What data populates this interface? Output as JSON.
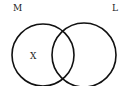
{
  "diagram": {
    "type": "venn",
    "sets": [
      {
        "id": "M",
        "label": "M",
        "cx": 43,
        "cy": 55,
        "r": 31
      },
      {
        "id": "L",
        "label": "L",
        "cx": 84,
        "cy": 55,
        "r": 32
      }
    ],
    "annotations": [
      {
        "id": "x",
        "text": "X",
        "region": "M only"
      }
    ],
    "stroke_color": "#111111",
    "stroke_width": 1.6,
    "background": "#ffffff"
  }
}
